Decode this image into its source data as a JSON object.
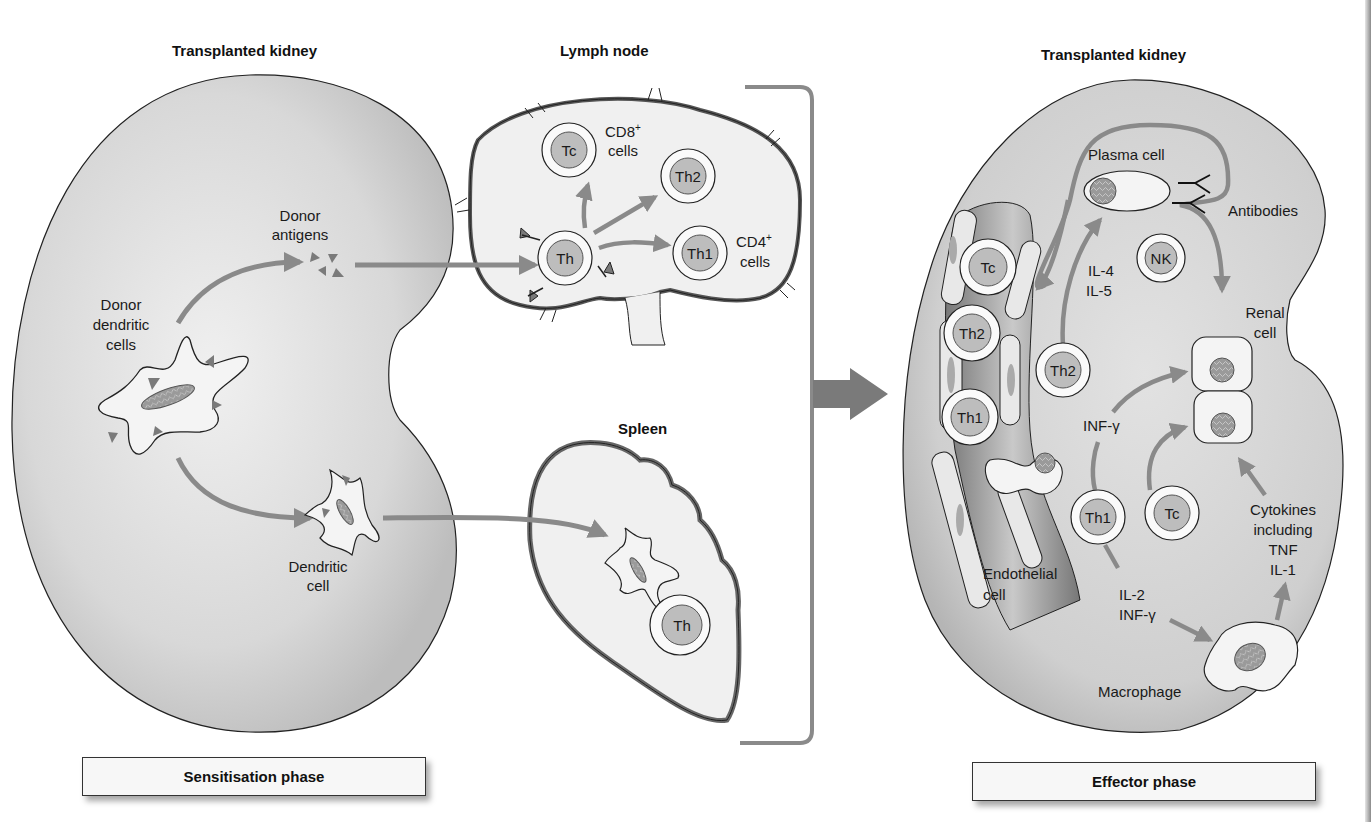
{
  "sensitisation": {
    "kidney_title": "Transplanted kidney",
    "donor_dendritic_cells": [
      "Donor",
      "dendritic",
      "cells"
    ],
    "donor_antigens": [
      "Donor",
      "antigens"
    ],
    "dendritic_cell": [
      "Dendritic",
      "cell"
    ],
    "lymph_node": {
      "title": "Lymph node",
      "cells": {
        "tc": "Tc",
        "th": "Th",
        "th2": "Th2",
        "th1": "Th1"
      },
      "cd8": "CD8",
      "cd8_sup": "+",
      "cd8_cells": "cells",
      "cd4": "CD4",
      "cd4_sup": "+",
      "cd4_cells": "cells"
    },
    "spleen": {
      "title": "Spleen",
      "th": "Th"
    },
    "phase_label": "Sensitisation phase"
  },
  "effector": {
    "kidney_title": "Transplanted kidney",
    "vessel_cells": {
      "tc": "Tc",
      "th2": "Th2",
      "th1": "Th1"
    },
    "plasma_cell": "Plasma cell",
    "antibodies": "Antibodies",
    "nk": "NK",
    "il4": "IL-4",
    "il5": "IL-5",
    "th2": "Th2",
    "renal_cell": [
      "Renal",
      "cell"
    ],
    "inf_gamma": "INF-γ",
    "th1": "Th1",
    "tc": "Tc",
    "cytokines": [
      "Cytokines",
      "including",
      "TNF",
      "IL-1"
    ],
    "endothelial_cell": [
      "Endothelial",
      "cell"
    ],
    "il2": "IL-2",
    "inf_gamma2": "INF-γ",
    "macrophage": "Macrophage",
    "phase_label": "Effector phase"
  },
  "colors": {
    "kidney_fill": "#d6d6d6",
    "organ_fill": "#f2f2f2",
    "arrow": "#8a8a8a",
    "cell_nucleus": "#bdbdbd",
    "outline": "#1a1a1a"
  }
}
